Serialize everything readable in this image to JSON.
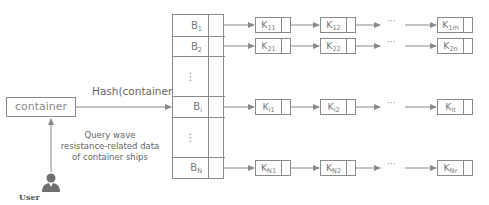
{
  "diagram": {
    "container_label": "container",
    "hash_label": "Hash(container)",
    "query_label": "Query wave resistance-related data of container ships",
    "user_label": "User",
    "colors": {
      "line": "#8a8a8a",
      "text": "#777777",
      "user_icon": "#6f6f6f"
    },
    "buckets": [
      {
        "label": "B",
        "sub": "1",
        "kind": "bucket"
      },
      {
        "label": "B",
        "sub": "2",
        "kind": "bucket"
      },
      {
        "label": "⋮",
        "sub": "",
        "kind": "ellipsis"
      },
      {
        "label": "B",
        "sub": "i",
        "kind": "bucket"
      },
      {
        "label": "⋮",
        "sub": "",
        "kind": "ellipsis"
      },
      {
        "label": "B",
        "sub": "N",
        "kind": "bucket"
      }
    ],
    "chains": [
      {
        "bucket": "B1",
        "nodes": [
          {
            "label": "K",
            "sub": "11"
          },
          {
            "label": "K",
            "sub": "12"
          }
        ],
        "ellipsis": "···",
        "last": {
          "label": "K",
          "sub": "1m"
        }
      },
      {
        "bucket": "B2",
        "nodes": [
          {
            "label": "K",
            "sub": "21"
          },
          {
            "label": "K",
            "sub": "22"
          }
        ],
        "ellipsis": "···",
        "last": {
          "label": "K",
          "sub": "2n"
        }
      },
      {
        "bucket": "Bi",
        "nodes": [
          {
            "label": "K",
            "sub": "i1"
          },
          {
            "label": "K",
            "sub": "i2"
          }
        ],
        "ellipsis": "···",
        "last": {
          "label": "K",
          "sub": "it"
        }
      },
      {
        "bucket": "BN",
        "nodes": [
          {
            "label": "K",
            "sub": "N1"
          },
          {
            "label": "K",
            "sub": "N2"
          }
        ],
        "ellipsis": "···",
        "last": {
          "label": "K",
          "sub": "Nr"
        }
      }
    ]
  }
}
